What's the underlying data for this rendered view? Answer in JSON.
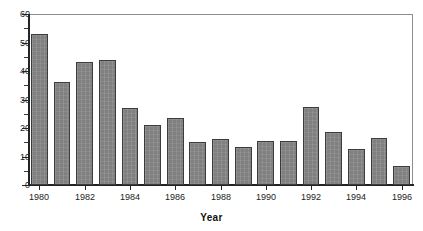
{
  "chart_data": {
    "type": "bar",
    "title": "",
    "xlabel": "Year",
    "ylabel": "",
    "categories": [
      1980,
      1981,
      1982,
      1983,
      1984,
      1985,
      1986,
      1987,
      1988,
      1989,
      1990,
      1991,
      1992,
      1993,
      1994,
      1995,
      1996
    ],
    "values": [
      53,
      36,
      43,
      44,
      27,
      21,
      23.5,
      15,
      16,
      13.5,
      15.5,
      15.5,
      27.5,
      18.5,
      12.5,
      16.5,
      6.5
    ],
    "xlim": [
      1979.5,
      1996.5
    ],
    "ylim": [
      0,
      60
    ],
    "ytick_labels": [
      "0",
      "10",
      "20",
      "30",
      "40",
      "50",
      "60"
    ],
    "ytick_values": [
      0,
      10,
      20,
      30,
      40,
      50,
      60
    ],
    "yminor_step": 5,
    "xtick_labels": [
      "1980",
      "1982",
      "1984",
      "1986",
      "1988",
      "1990",
      "1992",
      "1994",
      "1996"
    ],
    "xtick_values": [
      1980,
      1982,
      1984,
      1986,
      1988,
      1990,
      1992,
      1994,
      1996
    ],
    "grid": false,
    "legend": false,
    "legend_position": "none",
    "bar_color": "#808080",
    "bar_edge_color": "#3c3c3c",
    "axis_color": "#242424",
    "plot_border_color": "#8e8e8e",
    "background_color": "#ffffff"
  }
}
